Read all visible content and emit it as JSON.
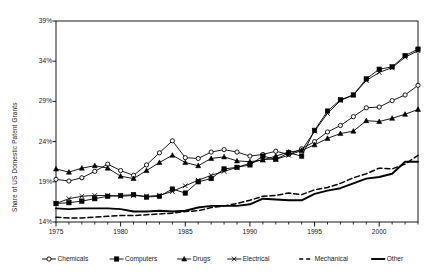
{
  "chart_data": {
    "type": "line",
    "title": "",
    "xlabel": "",
    "ylabel": "Share of US Domestic Patent Grants",
    "xlim": [
      1975,
      2003
    ],
    "ylim": [
      14,
      39
    ],
    "grid": false,
    "legend_position": "bottom",
    "y_tick_labels": [
      "39%",
      "34%",
      "29%",
      "24%",
      "19%",
      "14%"
    ],
    "y_ticks": [
      39,
      34,
      29,
      24,
      19,
      14
    ],
    "x_tick_labels": [
      "1975",
      "1980",
      "1985",
      "1990",
      "1995",
      "2000"
    ],
    "x_ticks": [
      1975,
      1980,
      1985,
      1990,
      1995,
      2000
    ],
    "x_minor_ticks": [
      1976,
      1977,
      1978,
      1979,
      1981,
      1982,
      1983,
      1984,
      1986,
      1987,
      1988,
      1989,
      1991,
      1992,
      1993,
      1994,
      1996,
      1997,
      1998,
      1999,
      2001,
      2002,
      2003
    ],
    "x": [
      1975,
      1976,
      1977,
      1978,
      1979,
      1980,
      1981,
      1982,
      1983,
      1984,
      1985,
      1986,
      1987,
      1988,
      1989,
      1990,
      1991,
      1992,
      1993,
      1994,
      1995,
      1996,
      1997,
      1998,
      1999,
      2000,
      2001,
      2002,
      2003
    ],
    "series": [
      {
        "name": "Chemicals",
        "marker": "open-circle",
        "line": "solid-thin",
        "values": [
          19.3,
          19.1,
          19.5,
          20.3,
          21.2,
          20.4,
          19.8,
          21.1,
          22.6,
          24.1,
          22.0,
          21.9,
          22.7,
          23.0,
          22.7,
          22.2,
          22.4,
          22.8,
          22.4,
          23.1,
          24.0,
          25.2,
          26.0,
          27.1,
          28.2,
          28.3,
          29.1,
          29.8,
          31.0
        ]
      },
      {
        "name": "Computers",
        "marker": "filled-square",
        "line": "solid-thin",
        "values": [
          16.3,
          16.4,
          16.6,
          16.9,
          17.2,
          17.3,
          17.4,
          17.1,
          17.2,
          18.1,
          17.6,
          19.0,
          19.4,
          20.6,
          20.8,
          21.1,
          22.2,
          21.8,
          22.6,
          22.2,
          25.4,
          27.8,
          29.2,
          29.8,
          31.8,
          33.0,
          33.3,
          34.7,
          35.5
        ]
      },
      {
        "name": "Drugs",
        "marker": "filled-triangle",
        "line": "solid-thin",
        "values": [
          20.6,
          20.2,
          20.7,
          21.0,
          20.7,
          19.7,
          19.4,
          20.4,
          21.4,
          22.3,
          21.4,
          21.0,
          21.9,
          22.1,
          21.6,
          21.5,
          21.7,
          22.2,
          22.7,
          22.9,
          23.6,
          24.4,
          25.0,
          25.3,
          26.6,
          26.5,
          26.9,
          27.4,
          28.0
        ]
      },
      {
        "name": "Electrical",
        "marker": "x-cross",
        "line": "solid-thin",
        "values": [
          16.3,
          16.9,
          17.2,
          17.3,
          17.3,
          17.2,
          17.3,
          17.2,
          17.3,
          17.8,
          18.5,
          19.2,
          19.8,
          20.3,
          20.8,
          21.3,
          21.8,
          21.8,
          22.3,
          22.9,
          25.3,
          27.5,
          29.1,
          29.8,
          31.6,
          32.6,
          33.2,
          34.5,
          35.3
        ]
      },
      {
        "name": "Mechanical",
        "marker": "none",
        "line": "dashed",
        "values": [
          14.6,
          14.5,
          14.5,
          14.6,
          14.7,
          14.8,
          14.8,
          14.9,
          15.0,
          15.1,
          15.3,
          15.4,
          15.8,
          16.0,
          16.3,
          16.7,
          17.2,
          17.3,
          17.6,
          17.4,
          18.0,
          18.3,
          18.8,
          19.5,
          20.0,
          20.7,
          20.6,
          21.2,
          22.3
        ]
      },
      {
        "name": "Other",
        "marker": "none",
        "line": "solid-thick",
        "values": [
          15.7,
          15.6,
          15.7,
          15.7,
          15.7,
          15.6,
          15.3,
          15.3,
          15.4,
          15.3,
          15.4,
          15.8,
          16.0,
          16.0,
          16.0,
          16.2,
          16.9,
          16.8,
          16.7,
          16.7,
          17.5,
          17.9,
          18.2,
          18.8,
          19.4,
          19.6,
          20.0,
          21.5,
          21.5
        ]
      }
    ],
    "legend": [
      {
        "label": "Chemicals",
        "marker": "open-circle",
        "style": "solid-thin"
      },
      {
        "label": "Computers",
        "marker": "filled-square",
        "style": "solid-thin"
      },
      {
        "label": "Drugs",
        "marker": "filled-triangle",
        "style": "solid-thin"
      },
      {
        "label": "Electrical",
        "marker": "x-cross",
        "style": "solid-thin"
      },
      {
        "label": "Mechanical",
        "marker": "none",
        "style": "dashed"
      },
      {
        "label": "Other",
        "marker": "none",
        "style": "solid-thick"
      }
    ],
    "colors": {
      "line": "#000000",
      "axis": "#000000",
      "text": "#222222",
      "background": "#ffffff"
    }
  }
}
